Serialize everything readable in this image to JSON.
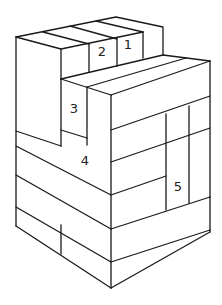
{
  "labels": [
    {
      "id": "1",
      "text": "1",
      "x": 128,
      "y": 45
    },
    {
      "id": "2",
      "text": "2",
      "x": 102,
      "y": 52
    },
    {
      "id": "3",
      "text": "3",
      "x": 74,
      "y": 109
    },
    {
      "id": "4",
      "text": "4",
      "x": 85,
      "y": 161
    },
    {
      "id": "5",
      "text": "5",
      "x": 178,
      "y": 187
    }
  ],
  "colors": {
    "line": "#1a1a1a",
    "background": "#ffffff"
  }
}
